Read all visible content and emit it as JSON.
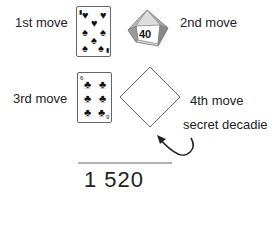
{
  "moves": [
    {
      "label": "1st move",
      "item": "card",
      "card": {
        "rank": "7",
        "suit": "hearts",
        "suit_glyph": "♥",
        "alt_glyph": "♠"
      }
    },
    {
      "label": "2nd move",
      "item": "d10-percentile-die",
      "die_value": "40",
      "die_side_value": "20"
    },
    {
      "label": "3rd move",
      "item": "card",
      "card": {
        "rank": "6",
        "suit": "clubs",
        "suit_glyph": "♣",
        "index_top": "6",
        "index_bottom": "9"
      }
    },
    {
      "label": "4th move",
      "item": "secret-decadie-placeholder"
    }
  ],
  "annotation": {
    "label": "secret decadie",
    "icon": "curved-arrow-icon"
  },
  "result": {
    "total": "1 520"
  }
}
